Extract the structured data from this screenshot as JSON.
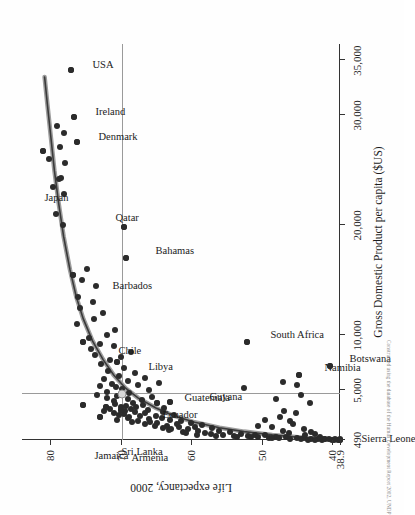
{
  "chart_data": {
    "type": "scatter",
    "title": "",
    "xlabel": "Gross Domestic Product per capita ($US)",
    "ylabel": "Life expectancy, 2000",
    "xlim": [
      490,
      36500
    ],
    "ylim": [
      38.9,
      84
    ],
    "xticks": [
      490,
      5000,
      10000,
      20000,
      30000,
      35000
    ],
    "xticklabels": [
      "490",
      "5,000",
      "10,000",
      "20,000",
      "30,000",
      "35,000"
    ],
    "yticks": [
      38.9,
      40,
      50,
      60,
      70,
      80
    ],
    "yticklabels": [
      "38.9",
      "40",
      "50",
      "60",
      "70",
      "80"
    ],
    "grid": false,
    "legend": null,
    "reference_lines": {
      "x_value": 4700,
      "y_value": 69.8,
      "color": "#9a9a9a"
    },
    "fit_curve": {
      "kind": "logarithmic",
      "color": "#6f6f6f",
      "points": [
        [
          490,
          39.5
        ],
        [
          700,
          44.0
        ],
        [
          950,
          48.5
        ],
        [
          1250,
          52.5
        ],
        [
          1600,
          56.0
        ],
        [
          2100,
          59.5
        ],
        [
          2700,
          62.5
        ],
        [
          3400,
          65.0
        ],
        [
          4300,
          67.5
        ],
        [
          5200,
          69.3
        ],
        [
          6400,
          71.0
        ],
        [
          7800,
          72.5
        ],
        [
          9500,
          74.0
        ],
        [
          11500,
          75.3
        ],
        [
          13500,
          76.3
        ],
        [
          16000,
          77.2
        ],
        [
          19000,
          78.1
        ],
        [
          22000,
          78.8
        ],
        [
          25000,
          79.4
        ],
        [
          28000,
          79.9
        ],
        [
          31000,
          80.4
        ],
        [
          33500,
          80.8
        ]
      ]
    },
    "labeled_points": [
      {
        "name": "Japan",
        "gdp": 26755,
        "life": 81.0
      },
      {
        "name": "USA",
        "gdp": 34142,
        "life": 77.0
      },
      {
        "name": "Ireland",
        "gdp": 29866,
        "life": 76.6
      },
      {
        "name": "Denmark",
        "gdp": 27627,
        "life": 76.2
      },
      {
        "name": "Barbados",
        "gdp": 15494,
        "life": 76.8
      },
      {
        "name": "Chile",
        "gdp": 9417,
        "life": 75.3
      },
      {
        "name": "Qatar",
        "gdp": 19844,
        "life": 69.6
      },
      {
        "name": "Bahamas",
        "gdp": 17012,
        "life": 69.2
      },
      {
        "name": "Libya",
        "gdp": 7570,
        "life": 70.5
      },
      {
        "name": "Jamaica",
        "gdp": 3639,
        "life": 75.3
      },
      {
        "name": "Sri Lanka",
        "gdp": 3530,
        "life": 72.1
      },
      {
        "name": "Armenia",
        "gdp": 2559,
        "life": 72.9
      },
      {
        "name": "Ecuador",
        "gdp": 3203,
        "life": 70.0
      },
      {
        "name": "Guatemala",
        "gdp": 3821,
        "life": 64.8
      },
      {
        "name": "Guyana",
        "gdp": 3963,
        "life": 63.0
      },
      {
        "name": "South Africa",
        "gdp": 9401,
        "life": 52.1
      },
      {
        "name": "Namibia",
        "gdp": 6431,
        "life": 44.7
      },
      {
        "name": "Botswana",
        "gdp": 7184,
        "life": 40.3
      },
      {
        "name": "Sierra Leone",
        "gdp": 490,
        "life": 38.9
      }
    ],
    "highlight_point": {
      "gdp": 4700,
      "life": 69.8
    },
    "points": [
      [
        34142,
        77.0
      ],
      [
        29866,
        76.6
      ],
      [
        27627,
        76.2
      ],
      [
        26755,
        81.0
      ],
      [
        28433,
        78.0
      ],
      [
        27096,
        78.6
      ],
      [
        29000,
        79.0
      ],
      [
        24277,
        78.4
      ],
      [
        24223,
        78.8
      ],
      [
        25657,
        77.9
      ],
      [
        23509,
        79.6
      ],
      [
        26050,
        80.2
      ],
      [
        22815,
        78.0
      ],
      [
        21000,
        79.2
      ],
      [
        20000,
        78.2
      ],
      [
        19844,
        69.6
      ],
      [
        17012,
        69.2
      ],
      [
        15494,
        76.8
      ],
      [
        16064,
        74.8
      ],
      [
        15000,
        75.5
      ],
      [
        14500,
        73.5
      ],
      [
        13500,
        76.0
      ],
      [
        13000,
        74.0
      ],
      [
        12500,
        75.8
      ],
      [
        12000,
        72.5
      ],
      [
        11500,
        73.8
      ],
      [
        11000,
        76.2
      ],
      [
        10500,
        70.8
      ],
      [
        10000,
        72.0
      ],
      [
        9800,
        74.5
      ],
      [
        9417,
        75.3
      ],
      [
        9401,
        52.1
      ],
      [
        9200,
        73.0
      ],
      [
        9000,
        71.0
      ],
      [
        8800,
        74.2
      ],
      [
        8500,
        68.5
      ],
      [
        8200,
        73.6
      ],
      [
        8000,
        70.0
      ],
      [
        7800,
        71.5
      ],
      [
        7570,
        70.5
      ],
      [
        7400,
        72.8
      ],
      [
        7184,
        40.3
      ],
      [
        7000,
        69.5
      ],
      [
        6800,
        71.8
      ],
      [
        6600,
        68.0
      ],
      [
        6431,
        44.7
      ],
      [
        6300,
        70.2
      ],
      [
        6100,
        66.5
      ],
      [
        6000,
        72.3
      ],
      [
        5900,
        69.0
      ],
      [
        5700,
        64.5
      ],
      [
        5600,
        71.2
      ],
      [
        5500,
        67.5
      ],
      [
        5400,
        73.0
      ],
      [
        5300,
        70.7
      ],
      [
        5200,
        52.5
      ],
      [
        5100,
        69.8
      ],
      [
        5000,
        66.0
      ],
      [
        4900,
        71.9
      ],
      [
        4800,
        68.8
      ],
      [
        4700,
        69.8
      ],
      [
        4600,
        73.4
      ],
      [
        4500,
        70.5
      ],
      [
        4400,
        65.5
      ],
      [
        4300,
        72.0
      ],
      [
        4200,
        69.0
      ],
      [
        4100,
        67.0
      ],
      [
        4000,
        71.0
      ],
      [
        3963,
        63.0
      ],
      [
        3900,
        68.2
      ],
      [
        3821,
        64.8
      ],
      [
        3750,
        70.8
      ],
      [
        3700,
        66.8
      ],
      [
        3639,
        75.3
      ],
      [
        3600,
        69.2
      ],
      [
        3530,
        72.1
      ],
      [
        3500,
        67.8
      ],
      [
        3450,
        70.0
      ],
      [
        3400,
        63.8
      ],
      [
        3350,
        71.5
      ],
      [
        3300,
        68.5
      ],
      [
        3250,
        66.2
      ],
      [
        3203,
        70.0
      ],
      [
        3150,
        72.4
      ],
      [
        3100,
        69.4
      ],
      [
        3050,
        64.0
      ],
      [
        3000,
        68.0
      ],
      [
        2950,
        71.0
      ],
      [
        2900,
        66.5
      ],
      [
        2850,
        69.6
      ],
      [
        2800,
        62.5
      ],
      [
        2750,
        70.2
      ],
      [
        2700,
        67.2
      ],
      [
        2650,
        65.0
      ],
      [
        2600,
        68.8
      ],
      [
        2559,
        72.9
      ],
      [
        2500,
        64.2
      ],
      [
        2450,
        69.0
      ],
      [
        2400,
        66.0
      ],
      [
        2350,
        70.5
      ],
      [
        2300,
        63.0
      ],
      [
        2250,
        67.5
      ],
      [
        2200,
        61.5
      ],
      [
        2150,
        65.8
      ],
      [
        2100,
        68.4
      ],
      [
        2050,
        60.0
      ],
      [
        2000,
        64.8
      ],
      [
        1950,
        62.0
      ],
      [
        1900,
        66.6
      ],
      [
        1850,
        58.5
      ],
      [
        1800,
        63.5
      ],
      [
        1750,
        65.2
      ],
      [
        1700,
        59.5
      ],
      [
        1650,
        61.8
      ],
      [
        1600,
        64.0
      ],
      [
        1550,
        57.0
      ],
      [
        1500,
        62.8
      ],
      [
        1450,
        60.5
      ],
      [
        1400,
        63.2
      ],
      [
        1350,
        56.0
      ],
      [
        1300,
        59.0
      ],
      [
        1250,
        61.2
      ],
      [
        1200,
        54.5
      ],
      [
        1150,
        58.0
      ],
      [
        1100,
        60.8
      ],
      [
        1050,
        53.0
      ],
      [
        1000,
        57.2
      ],
      [
        980,
        51.0
      ],
      [
        950,
        55.5
      ],
      [
        920,
        59.2
      ],
      [
        900,
        49.5
      ],
      [
        870,
        54.0
      ],
      [
        850,
        52.0
      ],
      [
        820,
        56.5
      ],
      [
        800,
        48.0
      ],
      [
        780,
        50.5
      ],
      [
        760,
        53.5
      ],
      [
        740,
        46.5
      ],
      [
        720,
        51.5
      ],
      [
        700,
        44.0
      ],
      [
        690,
        49.0
      ],
      [
        670,
        47.5
      ],
      [
        650,
        45.0
      ],
      [
        630,
        48.5
      ],
      [
        610,
        43.0
      ],
      [
        600,
        46.0
      ],
      [
        580,
        44.5
      ],
      [
        560,
        42.0
      ],
      [
        540,
        41.0
      ],
      [
        520,
        43.5
      ],
      [
        500,
        40.0
      ],
      [
        495,
        39.2
      ],
      [
        490,
        38.9
      ],
      [
        505,
        41.5
      ],
      [
        515,
        39.8
      ],
      [
        530,
        42.5
      ],
      [
        545,
        40.4
      ],
      [
        560,
        38.9
      ],
      [
        575,
        41.2
      ],
      [
        590,
        39.6
      ],
      [
        5800,
        47.0
      ],
      [
        4200,
        48.0
      ],
      [
        3100,
        46.8
      ],
      [
        2600,
        47.4
      ],
      [
        2200,
        46.0
      ],
      [
        1900,
        45.5
      ],
      [
        1500,
        44.0
      ],
      [
        1200,
        43.0
      ],
      [
        4600,
        44.5
      ],
      [
        3900,
        43.2
      ],
      [
        5500,
        45.0
      ],
      [
        1700,
        48.5
      ],
      [
        1000,
        42.5
      ],
      [
        800,
        41.8
      ],
      [
        1350,
        47.0
      ],
      [
        2900,
        45.2
      ],
      [
        2350,
        49.5
      ],
      [
        1800,
        50.5
      ],
      [
        1100,
        46.2
      ],
      [
        900,
        43.8
      ]
    ]
  },
  "footnote": "Constructed using the database of the Human Development Report 2002, UNDP"
}
